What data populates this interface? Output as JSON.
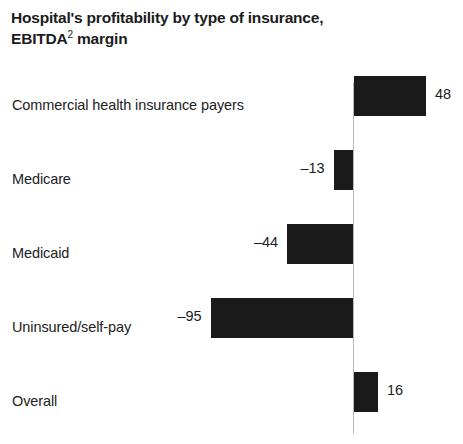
{
  "title": {
    "line1": "Hospital's profitability by type of insurance,",
    "line2_main": "EBITDA",
    "line2_sup": "2",
    "line2_tail": " margin"
  },
  "chart_data": {
    "type": "bar",
    "orientation": "horizontal",
    "title": "Hospital's profitability by type of insurance, EBITDA2 margin",
    "xlabel": "",
    "ylabel": "",
    "unit": "%",
    "grid": false,
    "legend": false,
    "zero_line": true,
    "xlim": [
      -100,
      55
    ],
    "categories": [
      "Commercial health insurance payers",
      "Medicare",
      "Medicaid",
      "Uninsured/self-pay",
      "Overall"
    ],
    "values": [
      48,
      -13,
      -44,
      -95,
      16
    ],
    "value_labels": [
      "48",
      "–13",
      "–44",
      "–95",
      "16"
    ],
    "bars": [
      {
        "category": "Commercial health insurance payers",
        "value": 48,
        "label": "48"
      },
      {
        "category": "Medicare",
        "value": -13,
        "label": "–13"
      },
      {
        "category": "Medicaid",
        "value": -44,
        "label": "–44"
      },
      {
        "category": "Uninsured/self-pay",
        "value": -95,
        "label": "–95"
      },
      {
        "category": "Overall",
        "value": 16,
        "label": "16"
      }
    ],
    "colors": {
      "bar": "#1a1a1a",
      "zero_line": "#b9b9b9",
      "background": "#ffffff",
      "text": "#222222"
    }
  },
  "geometry": {
    "zero_x": 353,
    "px_per_unit": 1.5,
    "bar_height": 40,
    "row_height": 74,
    "row_tops": [
      0,
      74,
      148,
      222,
      296
    ],
    "label_baselines": [
      40,
      114,
      188,
      262,
      336
    ]
  }
}
